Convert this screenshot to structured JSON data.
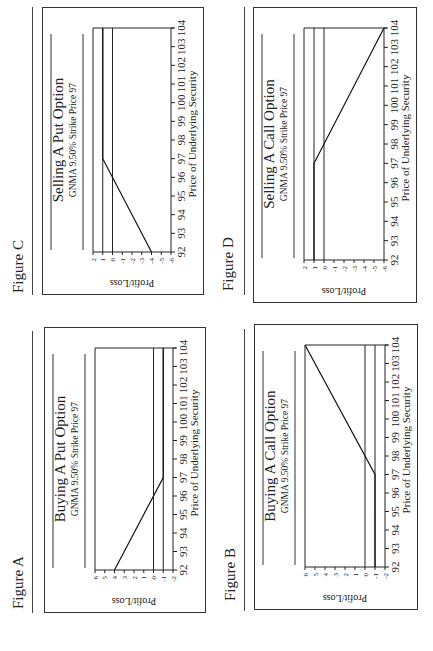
{
  "figures": [
    {
      "id": "A",
      "label": "Figure A",
      "slot": "top-left",
      "title": "Buying A Put Option",
      "subtitle": "GNMA 9.50% Strike Price 97",
      "xlabel": "Price of Underlying Security",
      "ylabel": "Profit/Loss"
    },
    {
      "id": "C",
      "label": "Figure C",
      "slot": "top-right",
      "title": "Selling A Put Option",
      "subtitle": "GNMA 9.50% Strike Price 97",
      "xlabel": "Price of Underlying Security",
      "ylabel": "Profit/Loss"
    },
    {
      "id": "B",
      "label": "Figure B",
      "slot": "bottom-left",
      "title": "Buying A Call Option",
      "subtitle": "GNMA 9.50% Strike Price 97",
      "xlabel": "Price of Underlying Security",
      "ylabel": "Profit/Loss"
    },
    {
      "id": "D",
      "label": "Figure D",
      "slot": "bottom-right",
      "title": "Selling A Call Option",
      "subtitle": "GNMA 9.50% Strike Price 97",
      "xlabel": "Price of Underlying Security",
      "ylabel": "Profit/Loss"
    }
  ],
  "chart_data": [
    {
      "figure": "Figure A",
      "type": "line",
      "title": "Buying A Put Option",
      "subtitle": "GNMA 9.50% Strike Price 97",
      "xlabel": "Price of Underlying Security",
      "ylabel": "Profit/Loss",
      "x_ticks": [
        92,
        93,
        94,
        95,
        96,
        97,
        98,
        99,
        100,
        101,
        102,
        103,
        104
      ],
      "y_ticks": [
        6,
        5,
        4,
        3,
        2,
        1,
        0,
        -1,
        -2
      ],
      "xlim": [
        92,
        104
      ],
      "ylim": [
        -2,
        6
      ],
      "reference_lines": [
        0,
        -1
      ],
      "series": [
        {
          "name": "Profit/Loss",
          "x": [
            92,
            97,
            104
          ],
          "y": [
            4,
            -1,
            -1
          ]
        }
      ]
    },
    {
      "figure": "Figure B",
      "type": "line",
      "title": "Buying A Call Option",
      "subtitle": "GNMA 9.50% Strike Price 97",
      "xlabel": "Price of Underlying Security",
      "ylabel": "Profit/Loss",
      "x_ticks": [
        92,
        93,
        94,
        95,
        96,
        97,
        98,
        99,
        100,
        101,
        102,
        103,
        104
      ],
      "y_ticks": [
        6,
        5,
        4,
        3,
        2,
        1,
        0,
        -1,
        -2
      ],
      "xlim": [
        92,
        104
      ],
      "ylim": [
        -2,
        6
      ],
      "reference_lines": [
        0,
        -1
      ],
      "series": [
        {
          "name": "Profit/Loss",
          "x": [
            92,
            97,
            104
          ],
          "y": [
            -1,
            -1,
            6
          ]
        }
      ]
    },
    {
      "figure": "Figure C",
      "type": "line",
      "title": "Selling A Put Option",
      "subtitle": "GNMA 9.50% Strike Price 97",
      "xlabel": "Price of Underlying Security",
      "ylabel": "Profit/Loss",
      "x_ticks": [
        92,
        93,
        94,
        95,
        96,
        97,
        98,
        99,
        100,
        101,
        102,
        103,
        104
      ],
      "y_ticks": [
        2,
        1,
        0,
        -1,
        -2,
        -3,
        -4,
        -5,
        -6
      ],
      "xlim": [
        92,
        104
      ],
      "ylim": [
        -6,
        2
      ],
      "reference_lines": [
        1,
        0
      ],
      "series": [
        {
          "name": "Profit/Loss",
          "x": [
            92,
            97,
            104
          ],
          "y": [
            -4,
            1,
            1
          ]
        }
      ]
    },
    {
      "figure": "Figure D",
      "type": "line",
      "title": "Selling A Call Option",
      "subtitle": "GNMA 9.50% Strike Price 97",
      "xlabel": "Price of Underlying Security",
      "ylabel": "Profit/Loss",
      "x_ticks": [
        92,
        93,
        94,
        95,
        96,
        97,
        98,
        99,
        100,
        101,
        102,
        103,
        104
      ],
      "y_ticks": [
        2,
        1,
        0,
        -1,
        -2,
        -3,
        -4,
        -5,
        -6
      ],
      "xlim": [
        92,
        104
      ],
      "ylim": [
        -6,
        2
      ],
      "reference_lines": [
        1,
        0
      ],
      "series": [
        {
          "name": "Profit/Loss",
          "x": [
            92,
            97,
            104
          ],
          "y": [
            1,
            1,
            -6
          ]
        }
      ]
    }
  ]
}
